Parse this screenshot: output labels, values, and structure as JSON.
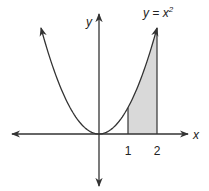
{
  "chart_data": {
    "type": "area",
    "title": "",
    "function_label": "y = x",
    "function_exponent": "2",
    "xlabel": "x",
    "ylabel": "y",
    "xlim": [
      -2.0,
      2.0
    ],
    "ylim": [
      0,
      4
    ],
    "curve": "y = x^2",
    "shaded_region": {
      "from": 1,
      "to": 2,
      "under": "y = x^2"
    },
    "x_tick_labels": [
      "1",
      "2"
    ],
    "x_ticks": [
      1,
      2
    ],
    "grid": false,
    "colors": {
      "line": "#333333",
      "shade": "#d9d9d9"
    }
  }
}
